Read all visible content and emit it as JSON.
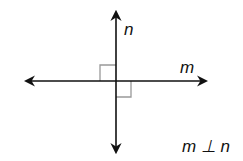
{
  "diagram": {
    "type": "perpendicular-lines",
    "lines": [
      {
        "name": "n",
        "orientation": "vertical",
        "label": "n"
      },
      {
        "name": "m",
        "orientation": "horizontal",
        "label": "m"
      }
    ],
    "right_angle_marks": 2,
    "statement": "m ⊥ n",
    "colors": {
      "line": "#111111",
      "right_angle_mark": "#999999"
    }
  }
}
